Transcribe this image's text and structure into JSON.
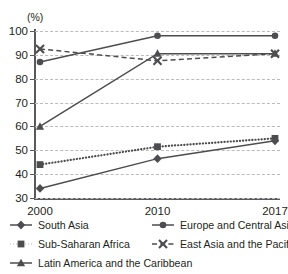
{
  "chart_data": {
    "type": "line",
    "title": "2000 to 2017",
    "xlabel": "",
    "ylabel": "(%)",
    "ylim": [
      30,
      100
    ],
    "yticks": [
      30,
      40,
      50,
      60,
      70,
      80,
      90,
      100
    ],
    "grid": true,
    "legend_position": "bottom",
    "categories": [
      "2000",
      "2010",
      "2017"
    ],
    "series": [
      {
        "name": "South Asia",
        "marker": "diamond",
        "line_style": "solid",
        "color": "#4d4d4f",
        "values": [
          34,
          46.5,
          54
        ]
      },
      {
        "name": "Sub-Saharan Africa",
        "marker": "square",
        "line_style": "dotted",
        "color": "#4d4d4f",
        "values": [
          44,
          51.5,
          55
        ]
      },
      {
        "name": "Latin America and the Caribbean",
        "marker": "triangle",
        "line_style": "solid",
        "color": "#4d4d4f",
        "values": [
          60,
          90.5,
          90.5
        ]
      },
      {
        "name": "Europe and Central Asia",
        "marker": "circle",
        "line_style": "solid",
        "color": "#4d4d4f",
        "values": [
          87,
          98,
          98
        ]
      },
      {
        "name": "East Asia and the Pacific",
        "marker": "x",
        "line_style": "dashed",
        "color": "#4d4d4f",
        "values": [
          92.5,
          87.5,
          90.5
        ]
      }
    ]
  },
  "legend": {
    "items": [
      {
        "label": "South Asia"
      },
      {
        "label": "Sub-Saharan Africa"
      },
      {
        "label": "Latin America and the Caribbean"
      },
      {
        "label": "Europe and Central Asia"
      },
      {
        "label": "East Asia and the Pacific"
      }
    ]
  },
  "colors": {
    "ink": "#231f20",
    "axis": "#58595b",
    "series": "#4d4d4f",
    "gridline": "#b9bbbd",
    "background": "#ffffff"
  }
}
